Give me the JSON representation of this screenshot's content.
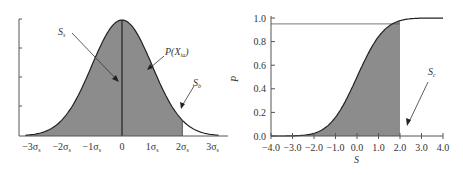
{
  "chart_data": [
    {
      "type": "area",
      "title": "",
      "description": "Normal probability density curve P(X_ia) with area left of 2σ shaded",
      "xlabel": "",
      "ylabel": "",
      "x_tick_labels": [
        "−3σ",
        "−2σ",
        "−1σ",
        "0",
        "1σ",
        "2σ",
        "3σ"
      ],
      "x_tick_subscript": "s",
      "x_ticks": [
        -3,
        -2,
        -1,
        0,
        1,
        2,
        3
      ],
      "xlim": [
        -3.5,
        3.5
      ],
      "curve": "normal_pdf",
      "shaded_range": [
        -3.5,
        2
      ],
      "vertical_line_at": 0,
      "annotations": [
        {
          "text": "S",
          "sub": "s",
          "points_to": "shaded area left of 0"
        },
        {
          "text": "P(X",
          "sub": "ia",
          "suffix": ")",
          "points_to": "curve"
        },
        {
          "text": "S",
          "sub": "b",
          "points_to": "unshaded tail right of 2σ"
        }
      ],
      "grid": false
    },
    {
      "type": "area",
      "title": "",
      "description": "Cumulative distribution of S, shaded up to S=2.0 (P≈0.95)",
      "xlabel": "S",
      "ylabel": "P",
      "x": [
        -4.0,
        -3.0,
        -2.0,
        -1.0,
        0.0,
        1.0,
        2.0,
        3.0,
        4.0
      ],
      "values": [
        0.0,
        0.01,
        0.05,
        0.15,
        0.5,
        0.84,
        0.95,
        0.99,
        1.0
      ],
      "x_tick_labels": [
        "−4.0",
        "−3.0",
        "−2.0",
        "−1.0",
        "0.0",
        "1.0",
        "2.0",
        "3.0",
        "4.0"
      ],
      "y_tick_labels": [
        "0.0",
        "0.2",
        "0.4",
        "0.6",
        "0.8",
        "1.0"
      ],
      "xlim": [
        -4.0,
        4.0
      ],
      "ylim": [
        0.0,
        1.0
      ],
      "shaded_range": [
        -4.0,
        2.0
      ],
      "reference_line_y": 0.95,
      "annotations": [
        {
          "text": "S",
          "sub": "c",
          "points_to": "x=2.0 boundary"
        }
      ],
      "grid": false
    }
  ],
  "left": {
    "ann_ss": "S",
    "ann_ss_sub": "s",
    "ann_p": "P(X",
    "ann_p_sub": "ia",
    "ann_p_close": ")",
    "ann_sb": "S",
    "ann_sb_sub": "b",
    "ticks": [
      {
        "pre": "−3σ",
        "sub": "s"
      },
      {
        "pre": "−2σ",
        "sub": "s"
      },
      {
        "pre": "−1σ",
        "sub": "s"
      },
      {
        "pre": "0",
        "sub": ""
      },
      {
        "pre": "1σ",
        "sub": "s"
      },
      {
        "pre": "2σ",
        "sub": "s"
      },
      {
        "pre": "3σ",
        "sub": "s"
      }
    ]
  },
  "right": {
    "xlabel": "S",
    "ylabel": "P",
    "ann_sc": "S",
    "ann_sc_sub": "c",
    "xticks": [
      "−4.0",
      "−3.0",
      "−2.0",
      "−1.0",
      "0.0",
      "1.0",
      "2.0",
      "3.0",
      "4.0"
    ],
    "yticks": [
      "0.0",
      "0.2",
      "0.4",
      "0.6",
      "0.8",
      "1.0"
    ]
  },
  "colors": {
    "fill": "#8c8c8c",
    "line": "#222222",
    "axis": "#555555",
    "text": "#333333"
  }
}
